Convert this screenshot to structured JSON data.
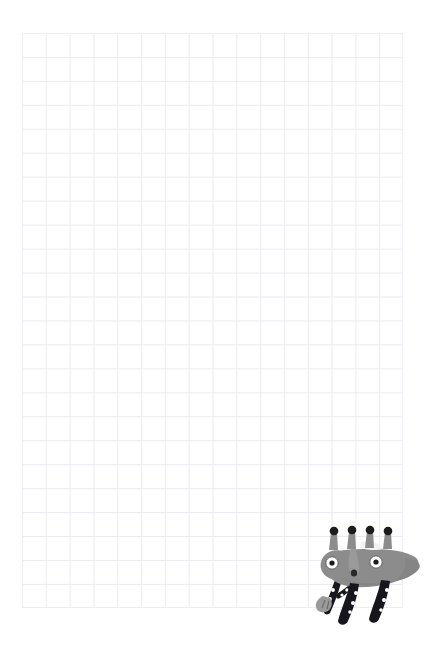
{
  "page": {
    "background_color": "#ffffff",
    "width": 445,
    "height": 655
  },
  "grid": {
    "name": "graph-paper-grid",
    "line_color": "#e9ebee",
    "cell_size_px": 24,
    "columns": 16,
    "rows": 24,
    "left": 22,
    "top": 33,
    "width": 381,
    "height": 575
  },
  "drawing": {
    "name": "creature-sketch",
    "subject": "four-horned gray creature",
    "position": {
      "left": 305,
      "top": 518,
      "width": 122,
      "height": 115
    },
    "colors": {
      "body": "#8c8c8c",
      "body_shadow": "#7e7e7e",
      "outline": "#7a7a7a",
      "legs": "#17161a",
      "leg_dots": "#ffffff",
      "eye_white": "#ffffff",
      "eye_pupil": "#1a1a1a",
      "horn_tip": "#1a1a1a",
      "ear_highlight": "#f2f2f2",
      "snout": "#9a9a9a"
    },
    "parts": {
      "horns": 4,
      "eyes": 2,
      "legs": 4,
      "leg_dots_per_leg": 3,
      "tail": 1,
      "ear": 1,
      "claw": 1
    }
  }
}
